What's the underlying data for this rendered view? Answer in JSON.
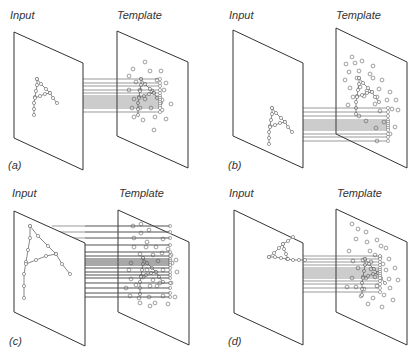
{
  "figure": {
    "width": 419,
    "height": 358,
    "colors": {
      "plane_edge": "#333333",
      "plane_fill": "#ffffff",
      "line": "#555555",
      "dot_stroke": "#777777",
      "text": "#333333"
    }
  },
  "panels": [
    {
      "id": "a",
      "caption": "(a)",
      "caption_pos": [
        8,
        166
      ],
      "input_label": "Input",
      "input_label_pos": [
        10,
        18
      ],
      "template_label": "Template",
      "template_label_pos": [
        117,
        18
      ],
      "input_plane": [
        [
          14,
          32
        ],
        [
          83,
          63
        ],
        [
          83,
          170
        ],
        [
          14,
          138
        ]
      ],
      "template_plane": [
        [
          117,
          31
        ],
        [
          188,
          62
        ],
        [
          188,
          168
        ],
        [
          117,
          136
        ]
      ],
      "input_letter": {
        "origin": [
          37,
          79
        ],
        "scale": 1.0,
        "rotate": 0
      },
      "template_letter": {
        "origin": [
          141,
          79
        ],
        "scale": 1.0,
        "rotate": 0
      },
      "line_band": {
        "x1": 83,
        "x2": 160,
        "ys": [
          79,
          83,
          86,
          90,
          93,
          96,
          98,
          100,
          102,
          104,
          106,
          108,
          112
        ]
      },
      "template_dots": [
        [
          145,
          62
        ],
        [
          133,
          69
        ],
        [
          150,
          71
        ],
        [
          161,
          71
        ],
        [
          129,
          76
        ],
        [
          157,
          80
        ],
        [
          136,
          82
        ],
        [
          166,
          83
        ],
        [
          129,
          90
        ],
        [
          140,
          90
        ],
        [
          152,
          91
        ],
        [
          164,
          90
        ],
        [
          134,
          99
        ],
        [
          145,
          99
        ],
        [
          162,
          100
        ],
        [
          171,
          104
        ],
        [
          132,
          108
        ],
        [
          140,
          108
        ],
        [
          151,
          108
        ],
        [
          162,
          110
        ],
        [
          134,
          117
        ],
        [
          143,
          120
        ],
        [
          155,
          117
        ],
        [
          166,
          119
        ],
        [
          154,
          130
        ]
      ]
    },
    {
      "id": "b",
      "caption": "(b)",
      "caption_pos": [
        228,
        166
      ],
      "input_label": "Input",
      "input_label_pos": [
        229,
        18
      ],
      "template_label": "Template",
      "template_label_pos": [
        336,
        18
      ],
      "input_plane": [
        [
          233,
          30
        ],
        [
          303,
          63
        ],
        [
          303,
          168
        ],
        [
          233,
          136
        ]
      ],
      "template_plane": [
        [
          336,
          28
        ],
        [
          407,
          62
        ],
        [
          407,
          168
        ],
        [
          336,
          134
        ]
      ],
      "input_letter": {
        "origin": [
          272,
          108
        ],
        "scale": 1.0,
        "rotate": 0
      },
      "template_letter": {
        "origin": [
          359,
          78
        ],
        "scale": 1.0,
        "rotate": 0
      },
      "line_band": {
        "x1": 303,
        "x2": 388,
        "ys": [
          108,
          112,
          116,
          120,
          122,
          124,
          126,
          128,
          130,
          134,
          137,
          141
        ]
      },
      "template_dots": [
        [
          352,
          57
        ],
        [
          346,
          64
        ],
        [
          355,
          63
        ],
        [
          362,
          61
        ],
        [
          373,
          66
        ],
        [
          349,
          72
        ],
        [
          359,
          71
        ],
        [
          370,
          74
        ],
        [
          345,
          80
        ],
        [
          357,
          78
        ],
        [
          373,
          78
        ],
        [
          382,
          80
        ],
        [
          350,
          88
        ],
        [
          360,
          87
        ],
        [
          367,
          91
        ],
        [
          379,
          89
        ],
        [
          390,
          92
        ],
        [
          353,
          97
        ],
        [
          364,
          96
        ],
        [
          377,
          97
        ],
        [
          387,
          100
        ],
        [
          396,
          100
        ],
        [
          348,
          105
        ],
        [
          375,
          104
        ],
        [
          392,
          109
        ],
        [
          359,
          116
        ],
        [
          380,
          111
        ],
        [
          398,
          110
        ],
        [
          366,
          121
        ],
        [
          384,
          122
        ],
        [
          395,
          127
        ],
        [
          376,
          128
        ],
        [
          390,
          134
        ],
        [
          377,
          141
        ]
      ]
    },
    {
      "id": "c",
      "caption": "(c)",
      "caption_pos": [
        9,
        342
      ],
      "input_label": "Input",
      "input_label_pos": [
        12,
        196
      ],
      "template_label": "Template",
      "template_label_pos": [
        119,
        196
      ],
      "input_plane": [
        [
          14,
          211
        ],
        [
          85,
          243
        ],
        [
          85,
          346
        ],
        [
          14,
          312
        ]
      ],
      "template_plane": [
        [
          118,
          210
        ],
        [
          189,
          242
        ],
        [
          189,
          345
        ],
        [
          118,
          312
        ]
      ],
      "input_letter": {
        "origin": [
          30,
          226
        ],
        "scale": 2.0,
        "rotate": 0
      },
      "template_letter": {
        "origin": [
          143,
          258
        ],
        "scale": 1.0,
        "rotate": 0
      },
      "line_band": {
        "x1": 52,
        "x2": 170,
        "ys": [
          226,
          232,
          238,
          245,
          252,
          256,
          259,
          261,
          263,
          265,
          268,
          272,
          275,
          278,
          283,
          288,
          293,
          297
        ]
      },
      "template_dots": [
        [
          133,
          226
        ],
        [
          141,
          224
        ],
        [
          149,
          230
        ],
        [
          141,
          233
        ],
        [
          134,
          238
        ],
        [
          147,
          242
        ],
        [
          163,
          239
        ],
        [
          134,
          247
        ],
        [
          146,
          247
        ],
        [
          156,
          247
        ],
        [
          168,
          249
        ],
        [
          140,
          254
        ],
        [
          153,
          255
        ],
        [
          162,
          253
        ],
        [
          171,
          255
        ],
        [
          176,
          260
        ],
        [
          131,
          263
        ],
        [
          158,
          261
        ],
        [
          172,
          263
        ],
        [
          129,
          270
        ],
        [
          147,
          270
        ],
        [
          163,
          270
        ],
        [
          177,
          272
        ],
        [
          131,
          279
        ],
        [
          143,
          277
        ],
        [
          153,
          280
        ],
        [
          160,
          283
        ],
        [
          171,
          283
        ],
        [
          126,
          288
        ],
        [
          136,
          285
        ],
        [
          150,
          286
        ],
        [
          157,
          286
        ],
        [
          130,
          296
        ],
        [
          139,
          298
        ],
        [
          149,
          297
        ],
        [
          163,
          296
        ],
        [
          175,
          297
        ],
        [
          140,
          303
        ],
        [
          150,
          306
        ],
        [
          155,
          303
        ],
        [
          168,
          304
        ]
      ]
    },
    {
      "id": "d",
      "caption": "(d)",
      "caption_pos": [
        228,
        342
      ],
      "input_label": "Input",
      "input_label_pos": [
        229,
        196
      ],
      "template_label": "Template",
      "template_label_pos": [
        337,
        196
      ],
      "input_plane": [
        [
          234,
          210
        ],
        [
          303,
          243
        ],
        [
          303,
          345
        ],
        [
          234,
          313
        ]
      ],
      "template_plane": [
        [
          336,
          209
        ],
        [
          407,
          242
        ],
        [
          407,
          345
        ],
        [
          336,
          312
        ]
      ],
      "input_letter": {
        "origin": [
          269,
          257
        ],
        "scale": 1.0,
        "rotate": -90
      },
      "template_letter": {
        "origin": [
          365,
          259
        ],
        "scale": 1.0,
        "rotate": 0
      },
      "line_band": {
        "x1": 303,
        "x2": 380,
        "ys": [
          256,
          259,
          262,
          265,
          268,
          270,
          272,
          274,
          276,
          278,
          281,
          284,
          288,
          292
        ]
      },
      "template_dots": [
        [
          352,
          224
        ],
        [
          358,
          229
        ],
        [
          366,
          232
        ],
        [
          356,
          239
        ],
        [
          367,
          242
        ],
        [
          377,
          240
        ],
        [
          381,
          246
        ],
        [
          370,
          251
        ],
        [
          386,
          248
        ],
        [
          349,
          251
        ],
        [
          375,
          255
        ],
        [
          380,
          257
        ],
        [
          389,
          259
        ],
        [
          353,
          261
        ],
        [
          363,
          260
        ],
        [
          371,
          262
        ],
        [
          383,
          264
        ],
        [
          395,
          268
        ],
        [
          358,
          268
        ],
        [
          371,
          269
        ],
        [
          386,
          270
        ],
        [
          352,
          278
        ],
        [
          366,
          278
        ],
        [
          375,
          277
        ],
        [
          389,
          279
        ],
        [
          398,
          280
        ],
        [
          347,
          287
        ],
        [
          356,
          287
        ],
        [
          364,
          289
        ],
        [
          377,
          286
        ],
        [
          390,
          288
        ],
        [
          361,
          296
        ],
        [
          373,
          298
        ],
        [
          384,
          295
        ],
        [
          393,
          300
        ],
        [
          368,
          304
        ],
        [
          382,
          307
        ]
      ]
    }
  ],
  "letter_shape": {
    "description": "Letter A drawn as chains of small circles",
    "left_leg": [
      [
        0,
        0
      ],
      [
        0,
        6
      ],
      [
        -1,
        12
      ],
      [
        -2,
        18
      ],
      [
        -3,
        24
      ],
      [
        -3,
        30
      ],
      [
        -3,
        36
      ]
    ],
    "diagonal": [
      [
        0,
        0
      ],
      [
        4,
        5
      ],
      [
        9,
        10
      ],
      [
        13,
        14
      ],
      [
        16,
        19
      ],
      [
        20,
        24
      ]
    ],
    "crossbar": [
      [
        -2,
        19
      ],
      [
        3,
        17
      ],
      [
        8,
        15
      ],
      [
        13,
        14
      ]
    ]
  }
}
